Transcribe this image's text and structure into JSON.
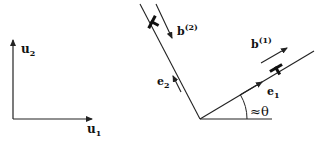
{
  "figure": {
    "left_frame": {
      "axis_x_label": "u",
      "axis_x_sub": "1",
      "axis_y_label": "u",
      "axis_y_sub": "2"
    },
    "right_frame": {
      "e1_label": "e",
      "e1_sub": "1",
      "e2_label": "e",
      "e2_sub": "2",
      "b1_label": "b",
      "b1_sup": "(1)",
      "b2_label": "b",
      "b2_sup": "(2)",
      "angle_label": "≈θ"
    },
    "colors": {
      "line": "#222222",
      "background": "#ffffff"
    }
  }
}
